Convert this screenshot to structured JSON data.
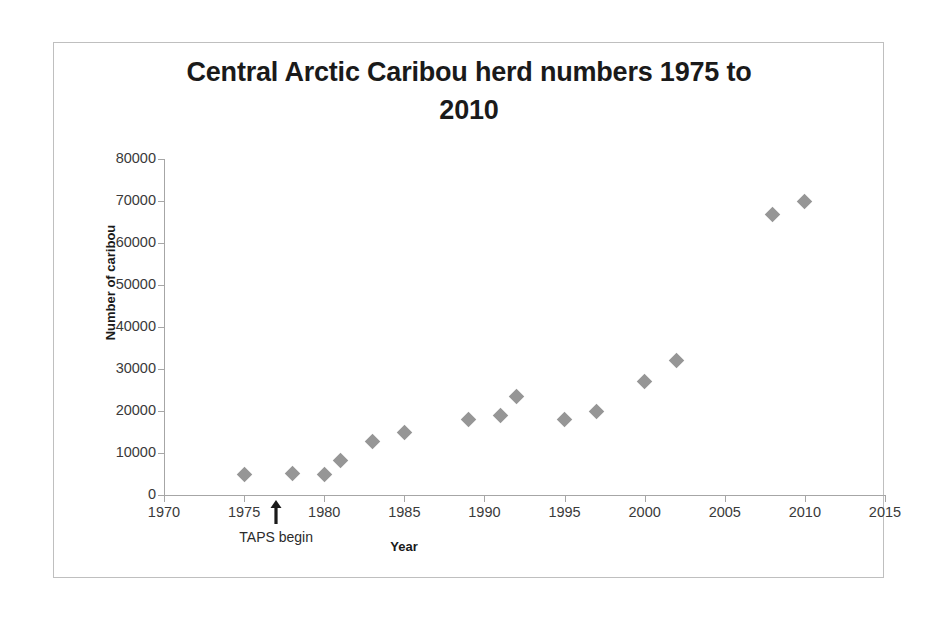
{
  "chart_data": {
    "type": "scatter",
    "title": "Central Arctic Caribou herd numbers 1975 to 2010",
    "title_line1": "Central Arctic Caribou herd numbers 1975 to",
    "title_line2": "2010",
    "xlabel": "Year",
    "ylabel": "Number of caribou",
    "xlim": [
      1970,
      2015
    ],
    "ylim": [
      0,
      80000
    ],
    "xticks": [
      1970,
      1975,
      1980,
      1985,
      1990,
      1995,
      2000,
      2005,
      2010,
      2015
    ],
    "yticks": [
      0,
      10000,
      20000,
      30000,
      40000,
      50000,
      60000,
      70000,
      80000
    ],
    "grid": false,
    "legend": null,
    "marker": {
      "shape": "diamond",
      "color": "#969696",
      "size": 11
    },
    "series": [
      {
        "name": "Central Arctic herd",
        "x": [
          1975,
          1978,
          1980,
          1981,
          1983,
          1985,
          1989,
          1991,
          1992,
          1995,
          1997,
          2000,
          2002,
          2008,
          2010
        ],
        "y": [
          4800,
          5200,
          4800,
          8300,
          12800,
          14900,
          18000,
          19000,
          23400,
          18000,
          19800,
          27000,
          32000,
          66700,
          70000
        ]
      }
    ],
    "annotations": [
      {
        "text": "TAPS begin",
        "x": 1977,
        "symbol": "up-arrow"
      }
    ]
  }
}
